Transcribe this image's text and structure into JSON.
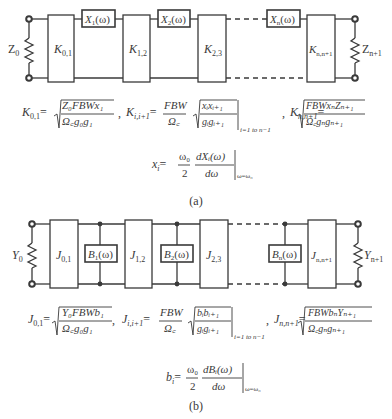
{
  "figure_a": {
    "caption": "(a)",
    "source_label": "Z",
    "source_sub": "0",
    "load_label": "Z",
    "load_sub": "n+1",
    "inverters": [
      {
        "sym": "K",
        "sub": "0,1"
      },
      {
        "sym": "K",
        "sub": "1,2"
      },
      {
        "sym": "K",
        "sub": "2,3"
      },
      {
        "sym": "K",
        "sub": "n,n+1"
      }
    ],
    "reactances": [
      {
        "sym": "X",
        "sub": "1",
        "arg": "(ω)"
      },
      {
        "sym": "X",
        "sub": "2",
        "arg": "(ω)"
      },
      {
        "sym": "X",
        "sub": "n",
        "arg": "(ω)"
      }
    ],
    "eq1": {
      "lhs": "K",
      "lhs_sub": "0,1",
      "num": "Z₀FBWx₁",
      "den": "Ω꜀g₀g₁"
    },
    "eq2": {
      "lhs": "K",
      "lhs_sub": "i,i+1",
      "pre_num": "FBW",
      "pre_den": "Ω꜀",
      "num": "xᵢxᵢ₊₁",
      "den": "gᵢgᵢ₊₁",
      "range": "i=1 to n−1"
    },
    "eq3": {
      "lhs": "K",
      "lhs_sub": "n,n+1",
      "num": "FBWxₙZₙ₊₁",
      "den": "Ω꜀gₙgₙ₊₁"
    },
    "slope": {
      "lhs": "x",
      "lhs_sub": "i",
      "f_num": "ω₀",
      "f_den": "2",
      "d_num": "dXᵢ(ω)",
      "d_den": "dω",
      "eval": "ω=ω₀"
    }
  },
  "figure_b": {
    "caption": "(b)",
    "source_label": "Y",
    "source_sub": "0",
    "load_label": "Y",
    "load_sub": "n+1",
    "inverters": [
      {
        "sym": "J",
        "sub": "0,1"
      },
      {
        "sym": "J",
        "sub": "1,2"
      },
      {
        "sym": "J",
        "sub": "2,3"
      },
      {
        "sym": "J",
        "sub": "n,n+1"
      }
    ],
    "susceptances": [
      {
        "sym": "B",
        "sub": "1",
        "arg": "(ω)"
      },
      {
        "sym": "B",
        "sub": "2",
        "arg": "(ω)"
      },
      {
        "sym": "B",
        "sub": "n",
        "arg": "(ω)"
      }
    ],
    "eq1": {
      "lhs": "J",
      "lhs_sub": "0,1",
      "num": "Y₀FBWb₁",
      "den": "Ω꜀g₀g₁"
    },
    "eq2": {
      "lhs": "J",
      "lhs_sub": "i,i+1",
      "pre_num": "FBW",
      "pre_den": "Ω꜀",
      "num": "bᵢbᵢ₊₁",
      "den": "gᵢgᵢ₊₁",
      "range": "i=1 to n−1"
    },
    "eq3": {
      "lhs": "J",
      "lhs_sub": "n,n+1",
      "num": "FBWbₙYₙ₊₁",
      "den": "Ω꜀gₙgₙ₊₁"
    },
    "slope": {
      "lhs": "b",
      "lhs_sub": "i",
      "f_num": "ω₀",
      "f_den": "2",
      "d_num": "dBᵢ(ω)",
      "d_den": "dω",
      "eval": "ω=ω₀"
    }
  },
  "symbols": {
    "equals": "=",
    "comma": ","
  },
  "colors": {
    "ink": "#3a3a3a",
    "background": "#ffffff"
  }
}
